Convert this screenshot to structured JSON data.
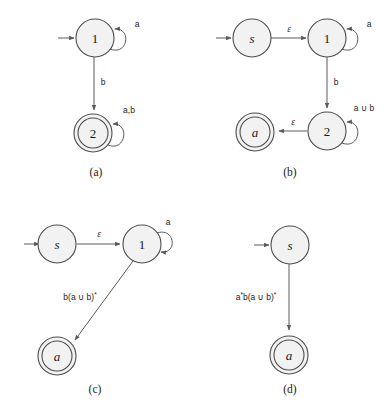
{
  "figure": {
    "background_color": "#ffffff",
    "state_fill_color": "#f2f2f2",
    "stroke_color": "#4d4d4d",
    "edge_color": "#5a5a5a",
    "text_color": "#1a1a1a"
  },
  "panels": [
    {
      "id": "a",
      "caption": "(a)",
      "states": [
        {
          "name": "1",
          "label": "1",
          "kind": "start",
          "accepting": false
        },
        {
          "name": "2",
          "label": "2",
          "kind": "normal",
          "accepting": true
        }
      ],
      "edges": [
        {
          "from": "start",
          "to": "1",
          "label": ""
        },
        {
          "from": "1",
          "to": "1",
          "label": "a",
          "kind": "self-loop"
        },
        {
          "from": "1",
          "to": "2",
          "label": "b",
          "kind": "straight"
        },
        {
          "from": "2",
          "to": "2",
          "label": "a,b",
          "kind": "self-loop"
        }
      ]
    },
    {
      "id": "b",
      "caption": "(b)",
      "states": [
        {
          "name": "s",
          "label": "s",
          "kind": "start",
          "accepting": false
        },
        {
          "name": "1",
          "label": "1",
          "kind": "normal",
          "accepting": false
        },
        {
          "name": "2",
          "label": "2",
          "kind": "normal",
          "accepting": false
        },
        {
          "name": "a",
          "label": "a",
          "kind": "normal",
          "accepting": true
        }
      ],
      "edges": [
        {
          "from": "start",
          "to": "s",
          "label": ""
        },
        {
          "from": "s",
          "to": "1",
          "label": "ε",
          "kind": "straight"
        },
        {
          "from": "1",
          "to": "1",
          "label": "a",
          "kind": "self-loop"
        },
        {
          "from": "1",
          "to": "2",
          "label": "b",
          "kind": "straight"
        },
        {
          "from": "2",
          "to": "2",
          "label": "a ∪ b",
          "kind": "self-loop"
        },
        {
          "from": "2",
          "to": "a",
          "label": "ε",
          "kind": "straight"
        }
      ]
    },
    {
      "id": "c",
      "caption": "(c)",
      "states": [
        {
          "name": "s",
          "label": "s",
          "kind": "start",
          "accepting": false
        },
        {
          "name": "1",
          "label": "1",
          "kind": "normal",
          "accepting": false
        },
        {
          "name": "a",
          "label": "a",
          "kind": "normal",
          "accepting": true
        }
      ],
      "edges": [
        {
          "from": "start",
          "to": "s",
          "label": ""
        },
        {
          "from": "s",
          "to": "1",
          "label": "ε",
          "kind": "straight"
        },
        {
          "from": "1",
          "to": "1",
          "label": "a",
          "kind": "self-loop"
        },
        {
          "from": "1",
          "to": "a",
          "label": "b(a ∪ b)*",
          "kind": "diagonal"
        }
      ]
    },
    {
      "id": "d",
      "caption": "(d)",
      "states": [
        {
          "name": "s",
          "label": "s",
          "kind": "start",
          "accepting": false
        },
        {
          "name": "a",
          "label": "a",
          "kind": "normal",
          "accepting": true
        }
      ],
      "edges": [
        {
          "from": "start",
          "to": "s",
          "label": ""
        },
        {
          "from": "s",
          "to": "a",
          "label": "a*b(a ∪ b)*",
          "kind": "straight"
        }
      ]
    }
  ],
  "labels": {
    "panel_a_loop1": "a",
    "panel_a_down": "b",
    "panel_a_loop2": "a,b",
    "panel_a_caption": "(a)",
    "panel_b_eps1": "ε",
    "panel_b_loop1": "a",
    "panel_b_down": "b",
    "panel_b_loop2": "a ∪ b",
    "panel_b_eps2": "ε",
    "panel_b_caption": "(b)",
    "panel_c_eps1": "ε",
    "panel_c_loop1": "a",
    "panel_c_diag_base": "b(a ∪ b)",
    "panel_c_diag_star": "*",
    "panel_c_caption": "(c)",
    "panel_d_base1": "a",
    "panel_d_star1": "*",
    "panel_d_base2": "b(a ∪ b)",
    "panel_d_star2": "*",
    "panel_d_caption": "(d)",
    "state_1": "1",
    "state_2": "2",
    "state_s": "s",
    "state_a": "a"
  }
}
